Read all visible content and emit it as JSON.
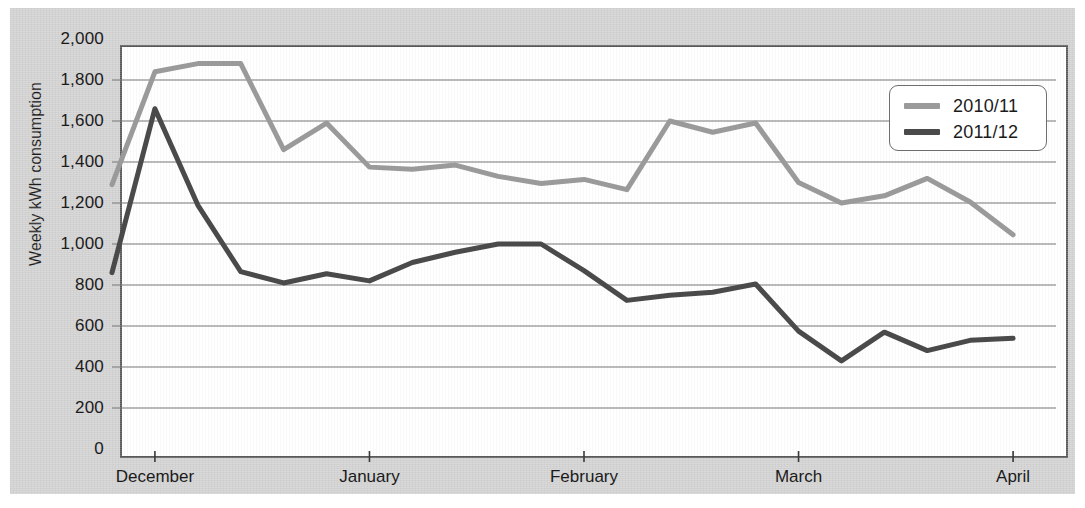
{
  "chart_data": {
    "type": "line",
    "title": "",
    "xlabel": "",
    "ylabel": "Weekly kWh consumption",
    "ylim": [
      0,
      2000
    ],
    "ytick_step": 200,
    "yticks": [
      "0",
      "200",
      "400",
      "600",
      "800",
      "1,000",
      "1,200",
      "1,400",
      "1,600",
      "1,800",
      "2,000"
    ],
    "ytick_values": [
      0,
      200,
      400,
      600,
      800,
      1000,
      1200,
      1400,
      1600,
      1800,
      2000
    ],
    "grid": "horizontal",
    "legend_position": "top-right",
    "xtick_labels": [
      "December",
      "January",
      "February",
      "March",
      "April"
    ],
    "xtick_positions_weeks": [
      1,
      6,
      11,
      16,
      21
    ],
    "x_weeks_total": 23,
    "series": [
      {
        "name": "2010/11",
        "color": "#9a9a9a",
        "values": [
          1290,
          1840,
          1880,
          1880,
          1460,
          1590,
          1375,
          1365,
          1385,
          1330,
          1295,
          1315,
          1265,
          1600,
          1545,
          1590,
          1300,
          1200,
          1235,
          1320,
          1205,
          1045
        ]
      },
      {
        "name": "2011/12",
        "color": "#4a4a4a",
        "values": [
          860,
          1660,
          1190,
          865,
          810,
          855,
          820,
          910,
          960,
          1000,
          1000,
          870,
          725,
          750,
          765,
          805,
          575,
          430,
          570,
          480,
          530,
          540
        ]
      }
    ]
  },
  "legend": {
    "items": [
      {
        "label": "2010/11",
        "color": "#9a9a9a"
      },
      {
        "label": "2011/12",
        "color": "#4a4a4a"
      }
    ]
  },
  "axes": {
    "y_title": "Weekly kWh consumption"
  },
  "colors": {
    "background": "#d2d2d2",
    "plot_background": "#ffffff",
    "frame": "#5a5a5a",
    "gridline": "#767676",
    "series_2010_11": "#9a9a9a",
    "series_2011_12": "#4a4a4a"
  }
}
